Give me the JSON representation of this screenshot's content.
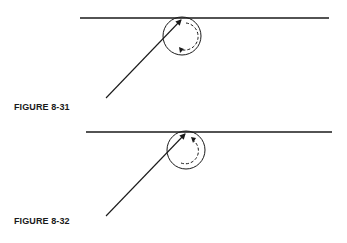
{
  "figures": [
    {
      "label": "FIGURE 8-31",
      "surface_line": {
        "x1": 80,
        "y1": 18,
        "x2": 329,
        "y2": 18
      },
      "incident_ray": {
        "x1": 106,
        "y1": 98,
        "x2": 181,
        "y2": 19
      },
      "circle": {
        "cx": 182,
        "cy": 36,
        "r": 19
      },
      "rotation": "clockwise"
    },
    {
      "label": "FIGURE 8-32",
      "surface_line": {
        "x1": 86,
        "y1": 132,
        "x2": 332,
        "y2": 132
      },
      "incident_ray": {
        "x1": 106,
        "y1": 216,
        "x2": 186,
        "y2": 133
      },
      "circle": {
        "cx": 186,
        "cy": 150,
        "r": 19
      },
      "rotation": "counterclockwise"
    }
  ],
  "colors": {
    "stroke": "#1a1a1a",
    "background": "#ffffff"
  }
}
